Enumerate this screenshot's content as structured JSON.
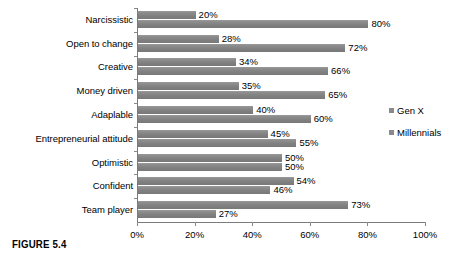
{
  "caption": "FIGURE 5.4",
  "legend": {
    "position": "right",
    "items": [
      {
        "label": "Gen X",
        "color": "#8a8a8a"
      },
      {
        "label": "Millennials",
        "color": "#8a8a8a"
      }
    ]
  },
  "axis": {
    "ticks": [
      "0%",
      "20%",
      "40%",
      "60%",
      "80%",
      "100%"
    ],
    "tick_values": [
      0,
      20,
      40,
      60,
      80,
      100
    ]
  },
  "chart_data": {
    "type": "bar",
    "orientation": "horizontal",
    "title": "",
    "xlabel": "",
    "ylabel": "",
    "xlim": [
      0,
      100
    ],
    "grid": false,
    "legend_position": "right",
    "value_suffix": "%",
    "categories": [
      "Narcissistic",
      "Open to change",
      "Creative",
      "Money driven",
      "Adaplable",
      "Entrepreneurial attitude",
      "Optimistic",
      "Confident",
      "Team player"
    ],
    "series": [
      {
        "name": "Gen X",
        "color": "#8a8a8a",
        "values": [
          20,
          28,
          34,
          35,
          40,
          45,
          50,
          54,
          73
        ],
        "labels": [
          "20%",
          "28%",
          "34%",
          "35%",
          "40%",
          "45%",
          "50%",
          "54%",
          "73%"
        ]
      },
      {
        "name": "Millennials",
        "color": "#8a8a8a",
        "values": [
          80,
          72,
          66,
          65,
          60,
          55,
          50,
          46,
          27
        ],
        "labels": [
          "80%",
          "72%",
          "66%",
          "65%",
          "60%",
          "55%",
          "50%",
          "46%",
          "27%"
        ]
      }
    ]
  }
}
